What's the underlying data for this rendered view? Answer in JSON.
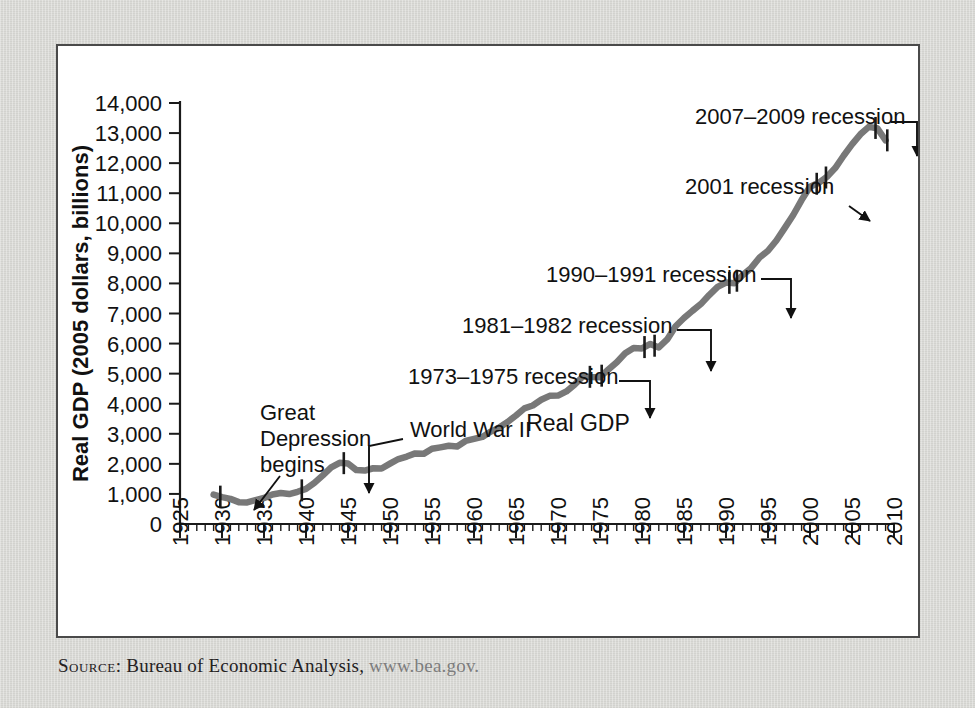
{
  "figure": {
    "source_prefix": "Source:",
    "source_text": " Bureau of Economic Analysis, ",
    "source_url": "www.bea.gov."
  },
  "chart_data": {
    "type": "line",
    "title": "",
    "xlabel": "Year",
    "ylabel": "Real GDP (2005 dollars, billions)",
    "series_label": "Real GDP",
    "xlim": [
      1925,
      2010
    ],
    "ylim": [
      0,
      14000
    ],
    "grid": false,
    "legend": "none",
    "line_color": "#787878",
    "axis_color": "#1a1a1a",
    "xticks": [
      1925,
      1930,
      1935,
      1940,
      1945,
      1950,
      1955,
      1960,
      1965,
      1970,
      1975,
      1980,
      1985,
      1990,
      1995,
      2000,
      2005,
      2010
    ],
    "xtick_labels": [
      "1925",
      "1930",
      "1935",
      "1940",
      "1945",
      "1950",
      "1955",
      "1960",
      "1965",
      "1970",
      "1975",
      "1980",
      "1985",
      "1990",
      "1995",
      "2000",
      "2005",
      "2010"
    ],
    "xminor_step": 1,
    "yticks": [
      0,
      1000,
      2000,
      3000,
      4000,
      5000,
      6000,
      7000,
      8000,
      9000,
      10000,
      11000,
      12000,
      13000,
      14000
    ],
    "ytick_labels": [
      "0",
      "1,000",
      "2,000",
      "3,000",
      "4,000",
      "5,000",
      "6,000",
      "7,000",
      "8,000",
      "9,000",
      "10,000",
      "11,000",
      "12,000",
      "13,000",
      "14,000"
    ],
    "x": [
      1929,
      1930,
      1931,
      1932,
      1933,
      1934,
      1935,
      1936,
      1937,
      1938,
      1939,
      1940,
      1941,
      1942,
      1943,
      1944,
      1945,
      1946,
      1947,
      1948,
      1949,
      1950,
      1951,
      1952,
      1953,
      1954,
      1955,
      1956,
      1957,
      1958,
      1959,
      1960,
      1961,
      1962,
      1963,
      1964,
      1965,
      1966,
      1967,
      1968,
      1969,
      1970,
      1971,
      1972,
      1973,
      1974,
      1975,
      1976,
      1977,
      1978,
      1979,
      1980,
      1981,
      1982,
      1983,
      1984,
      1985,
      1986,
      1987,
      1988,
      1989,
      1990,
      1991,
      1992,
      1993,
      1994,
      1995,
      1996,
      1997,
      1998,
      1999,
      2000,
      2001,
      2002,
      2003,
      2004,
      2005,
      2006,
      2007,
      2008,
      2009
    ],
    "y": [
      977,
      893,
      835,
      727,
      717,
      795,
      866,
      979,
      1030,
      995,
      1072,
      1166,
      1366,
      1618,
      1883,
      2035,
      2012,
      1792,
      1776,
      1854,
      1844,
      2006,
      2161,
      2244,
      2347,
      2332,
      2500,
      2549,
      2601,
      2578,
      2762,
      2830,
      2897,
      3072,
      3207,
      3392,
      3610,
      3845,
      3942,
      4133,
      4262,
      4270,
      4410,
      4643,
      4913,
      4889,
      4880,
      5141,
      5378,
      5677,
      5855,
      5839,
      5987,
      5871,
      6136,
      6577,
      6849,
      7087,
      7313,
      7614,
      7884,
      8028,
      8008,
      8280,
      8516,
      8863,
      9086,
      9426,
      9846,
      10275,
      10771,
      11216,
      11338,
      11543,
      11836,
      12247,
      12623,
      12959,
      13206,
      13162,
      12758
    ],
    "recession_markers": [
      {
        "year": 1929.8,
        "label": "Great Depression begins"
      },
      {
        "year": 1939.5,
        "label": "World War II start"
      },
      {
        "year": 1944.5,
        "label": "World War II"
      },
      {
        "year": 1973.8,
        "label": "1973-1975 recession start"
      },
      {
        "year": 1975.2,
        "label": "1973-1975 recession end"
      },
      {
        "year": 1980.3,
        "label": "1981-1982 recession start"
      },
      {
        "year": 1981.5,
        "label": "1981-1982 recession end"
      },
      {
        "year": 1990.4,
        "label": "1990-1991 recession start"
      },
      {
        "year": 1991.3,
        "label": "1990-1991 recession end"
      },
      {
        "year": 2000.8,
        "label": "2001 recession start"
      },
      {
        "year": 2001.9,
        "label": "2001 recession end"
      },
      {
        "year": 2007.8,
        "label": "2007-2009 recession start"
      },
      {
        "year": 2009.2,
        "label": "2007-2009 recession end"
      }
    ],
    "annotations": [
      {
        "id": "great-depression",
        "text_lines": [
          "Great",
          "Depression",
          "begins"
        ],
        "label_x": 202,
        "label_y": 374,
        "align": "left"
      },
      {
        "id": "world-war-2",
        "text_lines": [
          "World War II"
        ],
        "label_x": 352,
        "label_y": 391,
        "align": "left"
      },
      {
        "id": "recession-1973-1975",
        "text_lines": [
          "1973–1975 recession"
        ],
        "label_x": 350,
        "label_y": 338,
        "align": "left"
      },
      {
        "id": "recession-1981-1982",
        "text_lines": [
          "1981–1982 recession"
        ],
        "label_x": 404,
        "label_y": 287,
        "align": "left"
      },
      {
        "id": "recession-1990-1991",
        "text_lines": [
          "1990–1991 recession"
        ],
        "label_x": 488,
        "label_y": 236,
        "align": "left"
      },
      {
        "id": "recession-2001",
        "text_lines": [
          "2001 recession"
        ],
        "label_x": 627,
        "label_y": 148,
        "align": "left"
      },
      {
        "id": "recession-2007-2009",
        "text_lines": [
          "2007–2009 recession"
        ],
        "label_x": 637,
        "label_y": 78,
        "align": "left"
      }
    ]
  }
}
